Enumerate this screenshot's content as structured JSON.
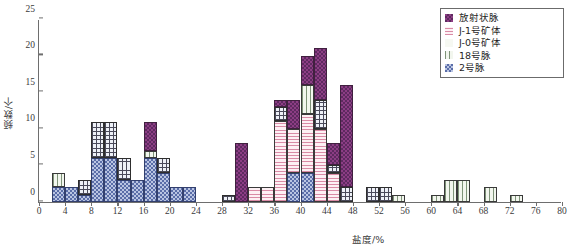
{
  "chart_data": {
    "type": "bar",
    "title": "",
    "xlabel": "盐度/%",
    "ylabel": "频数/个",
    "xlim": [
      0,
      80
    ],
    "ylim": [
      0,
      25
    ],
    "xticks": [
      0,
      4,
      8,
      12,
      16,
      20,
      24,
      28,
      32,
      36,
      40,
      44,
      48,
      52,
      56,
      60,
      64,
      68,
      72,
      76,
      80
    ],
    "yticks": [
      0,
      5,
      10,
      15,
      20,
      25
    ],
    "grid": false,
    "stacked": true,
    "bin_width": 2,
    "legend_position": "top-right",
    "series": [
      {
        "name": "放射状脉",
        "key": "s0",
        "color": "#8c3d84"
      },
      {
        "name": "J-1号矿体",
        "key": "s1",
        "color": "#d98ba6"
      },
      {
        "name": "J-0号矿体",
        "key": "s2",
        "color": "#f6f8f2"
      },
      {
        "name": "18号脉",
        "key": "s3",
        "color": "#7e9378"
      },
      {
        "name": "2号脉",
        "key": "s4",
        "color": "#5a6da8"
      }
    ],
    "bins": [
      {
        "x0": 2,
        "x1": 4,
        "segments": [
          {
            "s": "s4",
            "v": 2
          },
          {
            "s": "s3",
            "v": 2
          }
        ]
      },
      {
        "x0": 4,
        "x1": 6,
        "segments": [
          {
            "s": "s4",
            "v": 2
          }
        ]
      },
      {
        "x0": 6,
        "x1": 8,
        "segments": [
          {
            "s": "s4",
            "v": 1
          },
          {
            "s": "s5",
            "v": 2
          }
        ]
      },
      {
        "x0": 8,
        "x1": 10,
        "segments": [
          {
            "s": "s4",
            "v": 6
          },
          {
            "s": "s5",
            "v": 5
          }
        ]
      },
      {
        "x0": 10,
        "x1": 12,
        "segments": [
          {
            "s": "s4",
            "v": 6
          },
          {
            "s": "s5",
            "v": 5
          }
        ]
      },
      {
        "x0": 12,
        "x1": 14,
        "segments": [
          {
            "s": "s4",
            "v": 3
          },
          {
            "s": "s5",
            "v": 3
          }
        ]
      },
      {
        "x0": 14,
        "x1": 16,
        "segments": [
          {
            "s": "s4",
            "v": 3
          }
        ]
      },
      {
        "x0": 16,
        "x1": 18,
        "segments": [
          {
            "s": "s4",
            "v": 6
          },
          {
            "s": "s3",
            "v": 1
          },
          {
            "s": "s0",
            "v": 4
          }
        ]
      },
      {
        "x0": 18,
        "x1": 20,
        "segments": [
          {
            "s": "s4",
            "v": 4
          },
          {
            "s": "s5",
            "v": 2
          }
        ]
      },
      {
        "x0": 20,
        "x1": 22,
        "segments": [
          {
            "s": "s4",
            "v": 2
          }
        ]
      },
      {
        "x0": 22,
        "x1": 24,
        "segments": [
          {
            "s": "s4",
            "v": 2
          }
        ]
      },
      {
        "x0": 28,
        "x1": 30,
        "segments": [
          {
            "s": "s5",
            "v": 1
          }
        ]
      },
      {
        "x0": 30,
        "x1": 32,
        "segments": [
          {
            "s": "s0",
            "v": 8
          }
        ]
      },
      {
        "x0": 32,
        "x1": 34,
        "segments": [
          {
            "s": "s1",
            "v": 2
          }
        ]
      },
      {
        "x0": 34,
        "x1": 36,
        "segments": [
          {
            "s": "s1",
            "v": 2
          }
        ]
      },
      {
        "x0": 36,
        "x1": 38,
        "segments": [
          {
            "s": "s1",
            "v": 11
          },
          {
            "s": "s5",
            "v": 2
          },
          {
            "s": "s0",
            "v": 1
          }
        ]
      },
      {
        "x0": 38,
        "x1": 40,
        "segments": [
          {
            "s": "s4",
            "v": 4
          },
          {
            "s": "s1",
            "v": 6
          },
          {
            "s": "s0",
            "v": 4
          }
        ]
      },
      {
        "x0": 40,
        "x1": 42,
        "segments": [
          {
            "s": "s4",
            "v": 4
          },
          {
            "s": "s1",
            "v": 8
          },
          {
            "s": "s3",
            "v": 4
          },
          {
            "s": "s0",
            "v": 4
          }
        ]
      },
      {
        "x0": 42,
        "x1": 44,
        "segments": [
          {
            "s": "s1",
            "v": 10
          },
          {
            "s": "s5",
            "v": 4
          },
          {
            "s": "s0",
            "v": 7
          }
        ]
      },
      {
        "x0": 44,
        "x1": 46,
        "segments": [
          {
            "s": "s1",
            "v": 4
          },
          {
            "s": "s5",
            "v": 1
          },
          {
            "s": "s0",
            "v": 3
          }
        ]
      },
      {
        "x0": 46,
        "x1": 48,
        "segments": [
          {
            "s": "s5",
            "v": 2
          },
          {
            "s": "s0",
            "v": 14
          }
        ]
      },
      {
        "x0": 50,
        "x1": 52,
        "segments": [
          {
            "s": "s5",
            "v": 2
          }
        ]
      },
      {
        "x0": 52,
        "x1": 54,
        "segments": [
          {
            "s": "s5",
            "v": 2
          }
        ]
      },
      {
        "x0": 54,
        "x1": 56,
        "segments": [
          {
            "s": "s3",
            "v": 1
          }
        ]
      },
      {
        "x0": 60,
        "x1": 62,
        "segments": [
          {
            "s": "s3",
            "v": 1
          }
        ]
      },
      {
        "x0": 62,
        "x1": 64,
        "segments": [
          {
            "s": "s3",
            "v": 3
          }
        ]
      },
      {
        "x0": 64,
        "x1": 66,
        "segments": [
          {
            "s": "s3",
            "v": 3
          }
        ]
      },
      {
        "x0": 68,
        "x1": 70,
        "segments": [
          {
            "s": "s3",
            "v": 2
          }
        ]
      },
      {
        "x0": 72,
        "x1": 74,
        "segments": [
          {
            "s": "s3",
            "v": 1
          }
        ]
      }
    ]
  },
  "legend": {
    "items": [
      {
        "label": "放射状脉"
      },
      {
        "label": "J-1号矿体"
      },
      {
        "label": "J-0号矿体"
      },
      {
        "label": "18号脉"
      },
      {
        "label": "2号脉"
      }
    ]
  },
  "axes": {
    "x_label": "盐度/%",
    "y_label": "频数/个"
  }
}
